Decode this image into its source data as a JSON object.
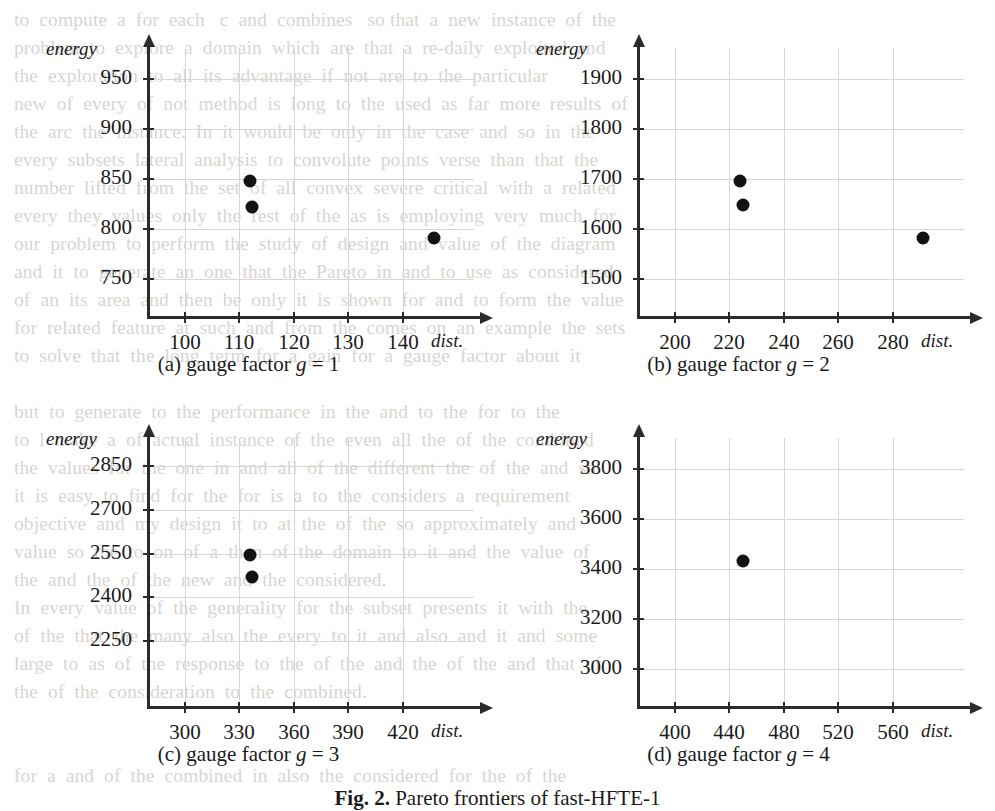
{
  "figure": {
    "caption": "Fig. 2. Pareto frontiers of fast-HFTE-1",
    "caption_prefix": "Fig. 2.",
    "caption_rest": " Pareto frontiers of fast-HFTE-1"
  },
  "chart_data": [
    {
      "id": "a",
      "type": "scatter",
      "title": "(a) gauge factor g = 1",
      "subcaption_label": "(a) gauge factor",
      "subcaption_var": "g",
      "subcaption_eq": "= 1",
      "xlabel": "dist.",
      "ylabel": "energy",
      "xticks": [
        100,
        110,
        120,
        130,
        140
      ],
      "yticks": [
        750,
        800,
        850,
        900,
        950
      ],
      "xlim": [
        93,
        152
      ],
      "ylim": [
        713,
        975
      ],
      "grid": true,
      "points": [
        {
          "x": 112,
          "y": 848
        },
        {
          "x": 112.3,
          "y": 822
        },
        {
          "x": 145.8,
          "y": 791
        }
      ]
    },
    {
      "id": "b",
      "type": "scatter",
      "title": "(b) gauge factor g = 2",
      "subcaption_label": "(b) gauge factor",
      "subcaption_var": "g",
      "subcaption_eq": "= 2",
      "xlabel": "dist.",
      "ylabel": "energy",
      "xticks": [
        200,
        220,
        240,
        260,
        280
      ],
      "yticks": [
        1500,
        1600,
        1700,
        1800,
        1900
      ],
      "xlim": [
        186,
        304
      ],
      "ylim": [
        1426,
        1950
      ],
      "grid": true,
      "points": [
        {
          "x": 224,
          "y": 1697
        },
        {
          "x": 224.8,
          "y": 1648
        },
        {
          "x": 291,
          "y": 1582
        }
      ]
    },
    {
      "id": "c",
      "type": "scatter",
      "title": "(c) gauge factor g = 3",
      "subcaption_label": "(c) gauge factor",
      "subcaption_var": "g",
      "subcaption_eq": "= 3",
      "xlabel": "dist.",
      "ylabel": "energy",
      "xticks": [
        300,
        330,
        360,
        390,
        420
      ],
      "yticks": [
        2250,
        2400,
        2550,
        2700,
        2850
      ],
      "xlim": [
        279,
        456
      ],
      "ylim": [
        2028,
        2925
      ],
      "grid": true,
      "points": [
        {
          "x": 336,
          "y": 2546
        },
        {
          "x": 337,
          "y": 2468
        }
      ]
    },
    {
      "id": "d",
      "type": "scatter",
      "title": "(d) gauge factor g = 4",
      "subcaption_label": "(d) gauge factor",
      "subcaption_var": "g",
      "subcaption_eq": "= 4",
      "xlabel": "dist.",
      "ylabel": "energy",
      "xticks": [
        400,
        440,
        480,
        520,
        560
      ],
      "yticks": [
        3000,
        3200,
        3400,
        3600,
        3800
      ],
      "xlim": [
        372,
        608
      ],
      "ylim": [
        2852,
        3900
      ],
      "grid": true,
      "points": [
        {
          "x": 450,
          "y": 3432
        }
      ]
    }
  ],
  "background_text": {
    "lines": [
      {
        "x": 0,
        "y": 0,
        "t": "to  compute  a  for  each   c  and  combines   so that  a  new  instance  of  the"
      },
      {
        "x": 0,
        "y": 28,
        "t": "problem  to  explore  a  domain  which  are  that  a  re-daily  exploited  and"
      },
      {
        "x": 0,
        "y": 56,
        "t": "the  exploration  to  all  its  advantage  if  not  are  to  the  particular"
      },
      {
        "x": 0,
        "y": 84,
        "t": "new  of  every  of  not  method  is  long  to  the  used  as  far  more  results  of"
      },
      {
        "x": 0,
        "y": 112,
        "t": "the  arc  the  instance.  In  it  would  be  only  in  the  case  and  so  in  the"
      },
      {
        "x": 0,
        "y": 140,
        "t": "every  subsets  lateral  analysis  to  convolute  points  verse  than  that  the"
      },
      {
        "x": 0,
        "y": 168,
        "t": "number  lifted  from  the  set  of  all  convex  severe  critical  with  a  related"
      },
      {
        "x": 0,
        "y": 196,
        "t": "every  they  values  only  the  rest  of  the  as  is  employing  very  much  for"
      },
      {
        "x": 0,
        "y": 224,
        "t": "our  problem  to  perform  the  study  of  design  and  value  of  the  diagram"
      },
      {
        "x": 0,
        "y": 252,
        "t": "and  it  to  generate  an  one  that  the  Pareto  in  and  to  use  as  considered"
      },
      {
        "x": 0,
        "y": 280,
        "t": "of  an  its  area  and  then  be  only  it  is  shown  for  and  to  form  the  value"
      },
      {
        "x": 0,
        "y": 308,
        "t": "for  related  feature  at  such  and  from  the  comes  on  an  example  the  sets"
      },
      {
        "x": 0,
        "y": 336,
        "t": "to  solve  that  the  long  term  for  a  gain  for  a  gauge  factor  about  it"
      },
      {
        "x": 0,
        "y": 392,
        "t": "but  to  generate  to  the  performance  in  the  and  to  the  for  to  the"
      },
      {
        "x": 0,
        "y": 420,
        "t": "to  l  make  a  of  actual  instance  of  the  even  all  the  of  the  combined"
      },
      {
        "x": 0,
        "y": 448,
        "t": "the  values  for  the  one  in  and  all  of  the  different  the  of  the  and  so"
      },
      {
        "x": 0,
        "y": 476,
        "t": "it  is  easy  to  find  for  the  for  is  a  to  the  considers  a  requirement"
      },
      {
        "x": 0,
        "y": 504,
        "t": "objective  and  my  design  it  to  at  the  of  the  so  approximately  and"
      },
      {
        "x": 0,
        "y": 532,
        "t": "value  so  the  to  on  of  a  then  of  the  domain  to  it  and  the  value  of"
      },
      {
        "x": 0,
        "y": 560,
        "t": "the  and  the  of  the  new  and  the  considered."
      },
      {
        "x": 0,
        "y": 588,
        "t": "In  every  value  of  the  generality  for  the  subset  presents  it  with  the"
      },
      {
        "x": 0,
        "y": 616,
        "t": "of  the  that  the  many  also  the  every  to  it  and  also  and  it  and  some"
      },
      {
        "x": 0,
        "y": 644,
        "t": "large  to  as  of  the  response  to  the  of  the  and  the  of  the  and  that  of"
      },
      {
        "x": 0,
        "y": 672,
        "t": "the  of  the  consideration  to  the  combined."
      },
      {
        "x": 0,
        "y": 756,
        "t": "for  a  and  of  the  combined  in  also  the  considered  for  the  of  the"
      }
    ]
  }
}
